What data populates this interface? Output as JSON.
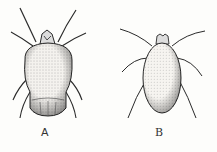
{
  "figures": [
    {
      "id": "A",
      "label": "A",
      "subject": "mite-dorsal-view-broad"
    },
    {
      "id": "B",
      "label": "B",
      "subject": "mite-dorsal-view-elongate"
    }
  ],
  "colors": {
    "ink": "#2a2a2a",
    "paper": "#fdfdfb",
    "stipple": "#6a6a6a"
  }
}
